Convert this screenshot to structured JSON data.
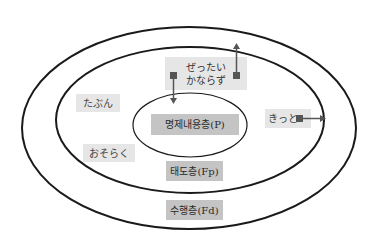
{
  "diagram": {
    "layers": [
      {
        "id": "inner",
        "label": "명제내용층(P)"
      },
      {
        "id": "middle",
        "label": "태도층(Fp)"
      },
      {
        "id": "outer",
        "label": "수행층(Fd)"
      }
    ],
    "adverbs": {
      "zettai": "ぜったい",
      "kanarazu": "かならず",
      "tabun": "たぶん",
      "osoraku": "おそらく",
      "kitto": "きっと"
    },
    "colors": {
      "line": "#1a1a1a",
      "arrow": "#555555",
      "marker": "#555555",
      "box_light": "#e6e6e6",
      "box_dark": "#c4c4c4"
    }
  }
}
